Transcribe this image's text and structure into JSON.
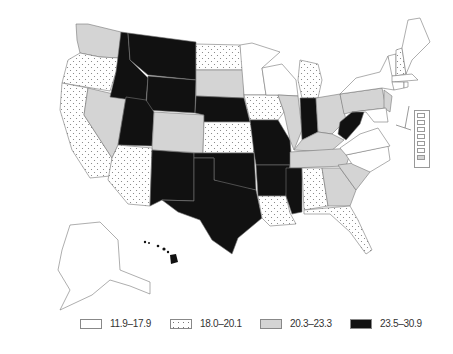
{
  "map": {
    "type": "choropleth",
    "region": "United States",
    "fills": {
      "white": "#ffffff",
      "dotted": "#ffffff",
      "lightgray": "#d4d4d4",
      "black": "#111111"
    }
  },
  "legend": {
    "items": [
      {
        "label": "11.9–17.9",
        "pattern": "white"
      },
      {
        "label": "18.0–20.1",
        "pattern": "dotted"
      },
      {
        "label": "20.3–23.3",
        "pattern": "lightgray"
      },
      {
        "label": "23.5–30.9",
        "pattern": "black"
      }
    ]
  },
  "states": {
    "WA": "lightgray",
    "OR": "dotted",
    "CA": "dotted",
    "NV": "lightgray",
    "ID": "black",
    "MT": "black",
    "WY": "black",
    "UT": "black",
    "CO": "lightgray",
    "AZ": "dotted",
    "NM": "black",
    "ND": "dotted",
    "SD": "lightgray",
    "NE": "black",
    "KS": "dotted",
    "OK": "black",
    "TX": "black",
    "MN": "white",
    "IA": "dotted",
    "MO": "black",
    "AR": "black",
    "LA": "dotted",
    "WI": "white",
    "IL": "lightgray",
    "MI": "dotted",
    "IN": "black",
    "OH": "lightgray",
    "KY": "lightgray",
    "TN": "lightgray",
    "MS": "black",
    "AL": "dotted",
    "GA": "lightgray",
    "FL": "dotted",
    "SC": "lightgray",
    "NC": "white",
    "VA": "white",
    "WV": "black",
    "PA": "lightgray",
    "NY": "white",
    "VT": "white",
    "NH": "dotted",
    "ME": "white",
    "MA": "white",
    "CT": "white",
    "RI": "white",
    "NJ": "lightgray",
    "DE": "white",
    "MD": "white",
    "AK": "white",
    "HI": "black"
  }
}
